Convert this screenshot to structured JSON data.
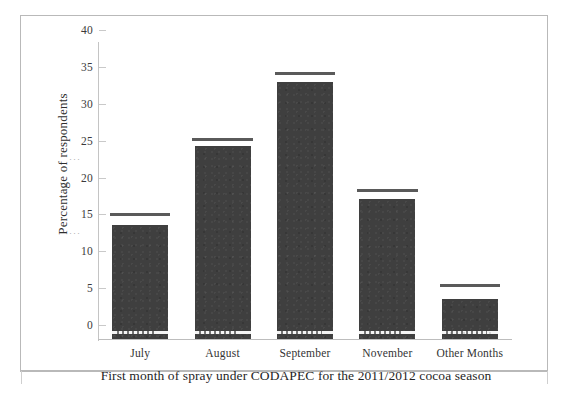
{
  "figure": {
    "y_axis_title": "Percentage of respondents",
    "x_axis_title": "First month of spray under CODAPEC  for the 2011/2012  cocoa season",
    "scan_residue": "",
    "bar_color": "#3f3f3f",
    "cap_color": "#5a5a5a",
    "frame_color": "#b9b9b9"
  },
  "chart_data": {
    "type": "bar",
    "title": "",
    "subtitle": "",
    "xlabel": "First month of spray under CODAPEC  for the 2011/2012  cocoa season",
    "ylabel": "Percentage of respondents",
    "categories": [
      "July",
      "August",
      "September",
      "November",
      "Other Months"
    ],
    "values": [
      15.5,
      26.2,
      34.8,
      19.0,
      5.4
    ],
    "cap_values": [
      16.7,
      26.8,
      35.8,
      20.0,
      7.1
    ],
    "series": [
      {
        "name": "Percentage of respondents",
        "values": [
          15.5,
          26.2,
          34.8,
          19.0,
          5.4
        ]
      }
    ],
    "ylim": [
      0,
      40
    ],
    "yticks": [
      0,
      5,
      10,
      15,
      20,
      25,
      30,
      35,
      40
    ],
    "ytick_labels": [
      "0",
      "5",
      "10",
      "15",
      "20",
      "25",
      "30",
      "35",
      "40"
    ],
    "grid": false,
    "legend": false,
    "legend_position": "none"
  }
}
